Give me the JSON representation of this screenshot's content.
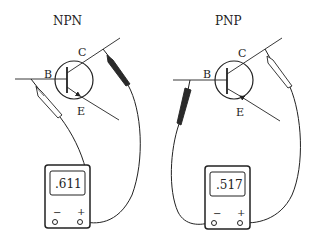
{
  "diagrams": [
    {
      "title": "NPN",
      "pins": {
        "base": "B",
        "collector": "C",
        "emitter": "E"
      },
      "emitter_arrow": "outward",
      "meter": {
        "reading": ".611",
        "neg_label": "−",
        "pos_label": "+"
      },
      "probes": {
        "red_lead_to": "B",
        "black_lead_to": "C"
      }
    },
    {
      "title": "PNP",
      "pins": {
        "base": "B",
        "collector": "C",
        "emitter": "E"
      },
      "emitter_arrow": "inward",
      "meter": {
        "reading": ".517",
        "neg_label": "−",
        "pos_label": "+"
      },
      "probes": {
        "black_lead_to": "B",
        "red_lead_to": "C"
      }
    }
  ],
  "colors": {
    "line": "#222222",
    "background": "#ffffff",
    "probe_dark": "#2a2a2a",
    "probe_light": "#ffffff"
  }
}
